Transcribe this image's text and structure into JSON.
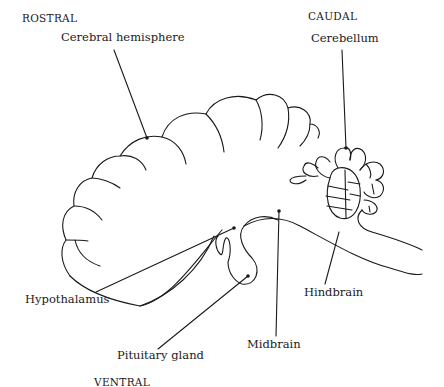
{
  "diagram": {
    "type": "anatomical-line-drawing",
    "orientation": {
      "rostral": "ROSTRAL",
      "caudal": "CAUDAL",
      "ventral": "VENTRAL"
    },
    "labels": {
      "cerebral_hemisphere": "Cerebral hemisphere",
      "cerebellum": "Cerebellum",
      "hypothalamus": "Hypothalamus",
      "pituitary_gland": "Pituitary gland",
      "midbrain": "Midbrain",
      "hindbrain": "Hindbrain"
    },
    "colors": {
      "ink": "#1a1a1a",
      "background": "#ffffff"
    }
  }
}
